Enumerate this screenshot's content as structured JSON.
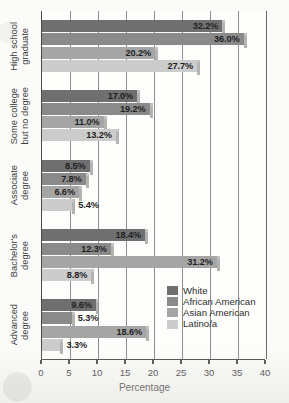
{
  "chart_data": {
    "type": "bar",
    "orientation": "horizontal",
    "title": "",
    "xlabel": "Percentage",
    "ylabel": "",
    "xlim": [
      0,
      40
    ],
    "xticks": [
      0,
      5,
      10,
      15,
      20,
      25,
      30,
      35,
      40
    ],
    "grid": true,
    "legend_position": "inside-right",
    "categories": [
      "High school graduate",
      "Some college but no degree",
      "Associate degree",
      "Bachelor's degree",
      "Advanced degree"
    ],
    "category_lines": [
      [
        "High school",
        "graduate"
      ],
      [
        "Some college",
        "but no degree"
      ],
      [
        "Associate",
        "degree"
      ],
      [
        "Bachelor's",
        "degree"
      ],
      [
        "Advanced",
        "degree"
      ]
    ],
    "series": [
      {
        "name": "White",
        "color": "#6f6f6f",
        "values": [
          32.2,
          17.0,
          8.5,
          18.4,
          9.6
        ],
        "labels": [
          "32.2%",
          "17.0%",
          "8.5%",
          "18.4%",
          "9.6%"
        ]
      },
      {
        "name": "African American",
        "color": "#8a8a8a",
        "values": [
          36.0,
          19.2,
          7.8,
          12.3,
          5.3
        ],
        "labels": [
          "36.0%",
          "19.2%",
          "7.8%",
          "12.3%",
          "5.3%"
        ]
      },
      {
        "name": "Asian American",
        "color": "#a5a5a5",
        "values": [
          20.2,
          11.0,
          6.6,
          31.2,
          18.6
        ],
        "labels": [
          "20.2%",
          "11.0%",
          "6.6%",
          "31.2%",
          "18.6%"
        ]
      },
      {
        "name": "Latino/a",
        "color": "#cccccc",
        "values": [
          27.7,
          13.2,
          5.4,
          8.8,
          3.3
        ],
        "labels": [
          "27.7%",
          "13.2%",
          "5.4%",
          "8.8%",
          "3.3%"
        ]
      }
    ]
  }
}
